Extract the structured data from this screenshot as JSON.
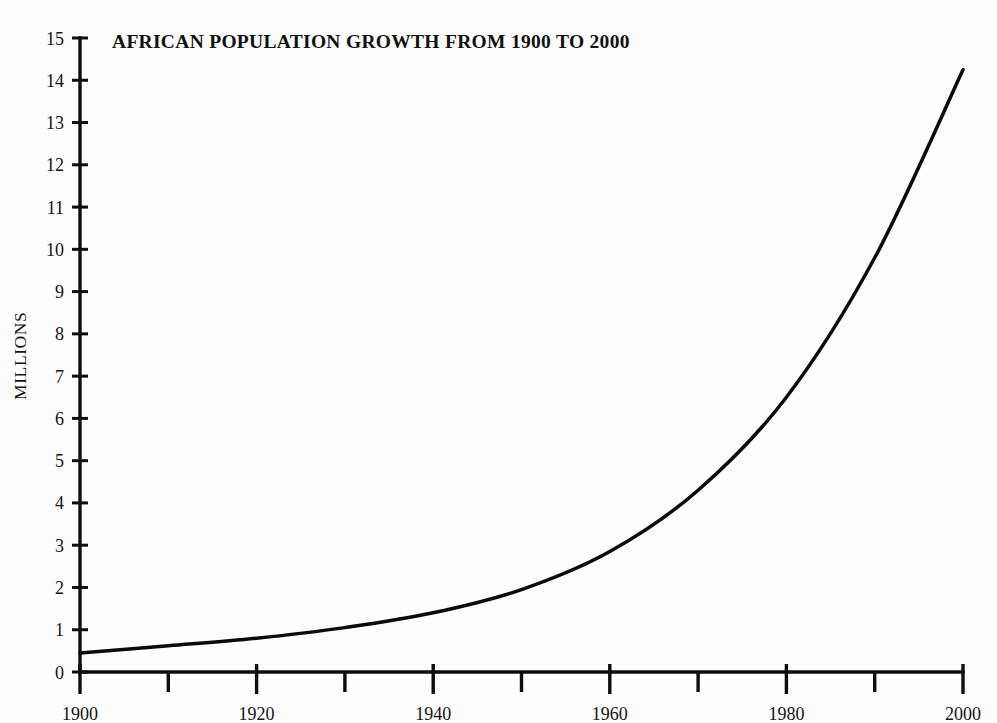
{
  "chart_data": {
    "type": "line",
    "title": "AFRICAN POPULATION GROWTH FROM 1900 TO 2000",
    "xlabel": "",
    "ylabel": "MILLIONS",
    "xlim": [
      1900,
      2000
    ],
    "ylim": [
      0,
      15
    ],
    "grid": false,
    "legend": null,
    "x_tick_labels": [
      "1900",
      "1920",
      "1940",
      "1960",
      "1980",
      "2000"
    ],
    "x_tick_values": [
      1900,
      1920,
      1940,
      1960,
      1980,
      2000
    ],
    "x_minor_tick_values": [
      1910,
      1930,
      1950,
      1970,
      1990
    ],
    "y_tick_labels": [
      "0",
      "1",
      "2",
      "3",
      "4",
      "5",
      "6",
      "7",
      "8",
      "9",
      "10",
      "11",
      "12",
      "13",
      "14",
      "15"
    ],
    "y_tick_values": [
      0,
      1,
      2,
      3,
      4,
      5,
      6,
      7,
      8,
      9,
      10,
      11,
      12,
      13,
      14,
      15
    ],
    "x": [
      1900,
      1910,
      1920,
      1930,
      1940,
      1950,
      1960,
      1970,
      1980,
      1990,
      2000
    ],
    "values": [
      0.45,
      0.62,
      0.8,
      1.05,
      1.4,
      1.95,
      2.85,
      4.3,
      6.5,
      9.8,
      14.25
    ],
    "series": [
      {
        "name": "African population",
        "values": [
          0.45,
          0.62,
          0.8,
          1.05,
          1.4,
          1.95,
          2.85,
          4.3,
          6.5,
          9.8,
          14.25
        ]
      }
    ],
    "line_color": "#0a0a0a",
    "background_color": "#fdfdfd"
  },
  "figure": {
    "caption": ""
  }
}
